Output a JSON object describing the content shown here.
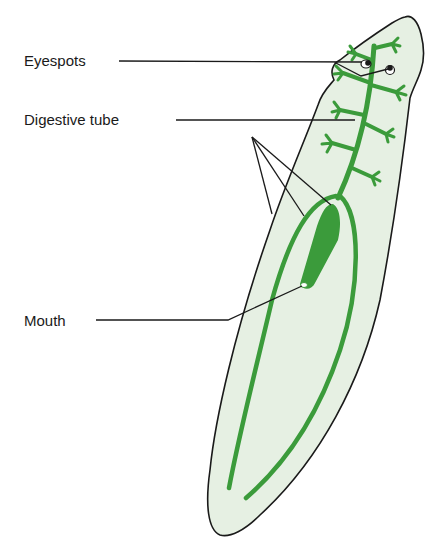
{
  "labels": {
    "eyespots": "Eyespots",
    "digestive_tube": "Digestive tube",
    "mouth": "Mouth"
  },
  "colors": {
    "body_fill": "#e6f0e3",
    "outline": "#1a1a1a",
    "gut": "#3b9b3b",
    "leader_line": "#1a1a1a",
    "background": "#ffffff"
  }
}
